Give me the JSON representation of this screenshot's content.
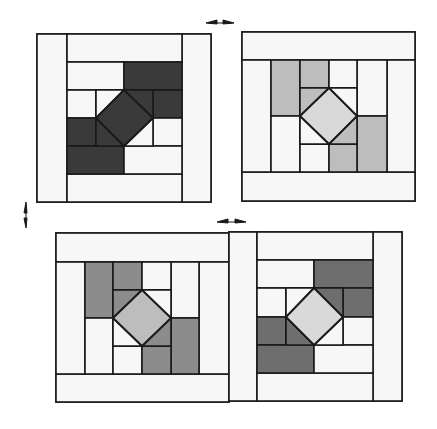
{
  "diagram": {
    "colors": {
      "background": "#ffffff",
      "outline": "#1a1a1a",
      "light": "#f2f2f2",
      "white": "#f7f7f7",
      "dark": "#3a3a3a",
      "medium": "#7a7a7a",
      "light_gray": "#bdbdbd",
      "center_light": "#d9d9d9"
    },
    "arrows": [
      {
        "name": "arrow-top-horizontal",
        "orientation": "horizontal",
        "x": 220,
        "y": 22
      },
      {
        "name": "arrow-left-vertical",
        "orientation": "vertical",
        "x": 27,
        "y": 215
      },
      {
        "name": "arrow-middle-horizontal",
        "orientation": "horizontal",
        "x": 231,
        "y": 221
      }
    ],
    "blocks": [
      {
        "id": "block-top-left",
        "position": "top-left",
        "center_fill": "dark",
        "accent_fill": "dark"
      },
      {
        "id": "block-top-right",
        "position": "top-right",
        "center_fill": "center_light",
        "accent_fill": "light_gray"
      },
      {
        "id": "block-bottom-left",
        "position": "bottom-left",
        "center_fill": "light_gray",
        "accent_fill": "medium"
      },
      {
        "id": "block-bottom-right",
        "position": "bottom-right",
        "center_fill": "center_light",
        "accent_fill": "medium"
      }
    ]
  }
}
